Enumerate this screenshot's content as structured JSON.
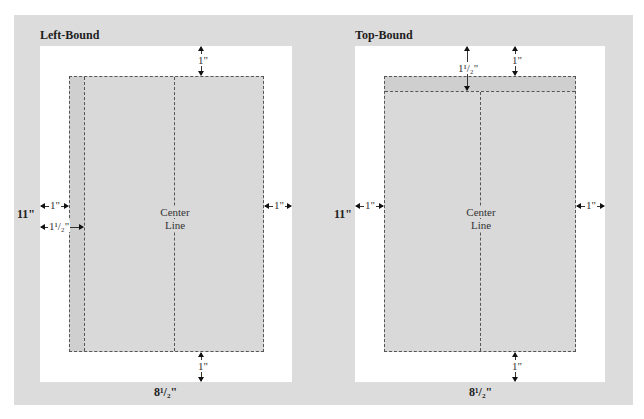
{
  "diagram": {
    "colors": {
      "background": "#dcdcdc",
      "page": "#ffffff",
      "text_area": "#d9d9d9",
      "binding_strip": "#cfcfcf",
      "dash": "#555555"
    },
    "left_panel": {
      "title": "Left-Bound",
      "center_label_1": "Center",
      "center_label_2": "Line",
      "height_label": "11\"",
      "width_label": "8¹/₂\"",
      "top_margin": "1\"",
      "bottom_margin": "1\"",
      "left_margin": "1\"",
      "binding_margin": "1¹/₂\"",
      "right_margin": "1\""
    },
    "right_panel": {
      "title": "Top-Bound",
      "center_label_1": "Center",
      "center_label_2": "Line",
      "height_label": "11\"",
      "width_label": "8¹/₂\"",
      "binding_margin": "1¹/₂\"",
      "top_margin": "1\"",
      "bottom_margin": "1\"",
      "left_margin": "1\"",
      "right_margin": "1\""
    }
  }
}
